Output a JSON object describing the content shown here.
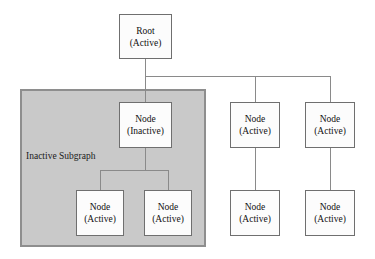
{
  "diagram": {
    "title_text": "Inactive Subgraph diagram",
    "colors": {
      "subgraph_fill": "#c9c9c9",
      "subgraph_border": "#8e8e8e",
      "node_fill": "#fcfcfc",
      "node_border": "#6f6f6f",
      "edge": "#8a8a8a",
      "text": "#111111",
      "background": "#ffffff"
    },
    "subgraph": {
      "label_line1": "Inactive",
      "label_line2": "Subgraph"
    },
    "nodes": [
      {
        "id": "root",
        "line1": "Root",
        "line2": "(Active)"
      },
      {
        "id": "inactive",
        "line1": "Node",
        "line2": "(Inactive)"
      },
      {
        "id": "sub-child-1",
        "line1": "Node",
        "line2": "(Active)"
      },
      {
        "id": "sub-child-2",
        "line1": "Node",
        "line2": "(Active)"
      },
      {
        "id": "branch-2",
        "line1": "Node",
        "line2": "(Active)"
      },
      {
        "id": "branch-3",
        "line1": "Node",
        "line2": "(Active)"
      },
      {
        "id": "leaf-2",
        "line1": "Node",
        "line2": "(Active)"
      },
      {
        "id": "leaf-3",
        "line1": "Node",
        "line2": "(Active)"
      }
    ]
  }
}
